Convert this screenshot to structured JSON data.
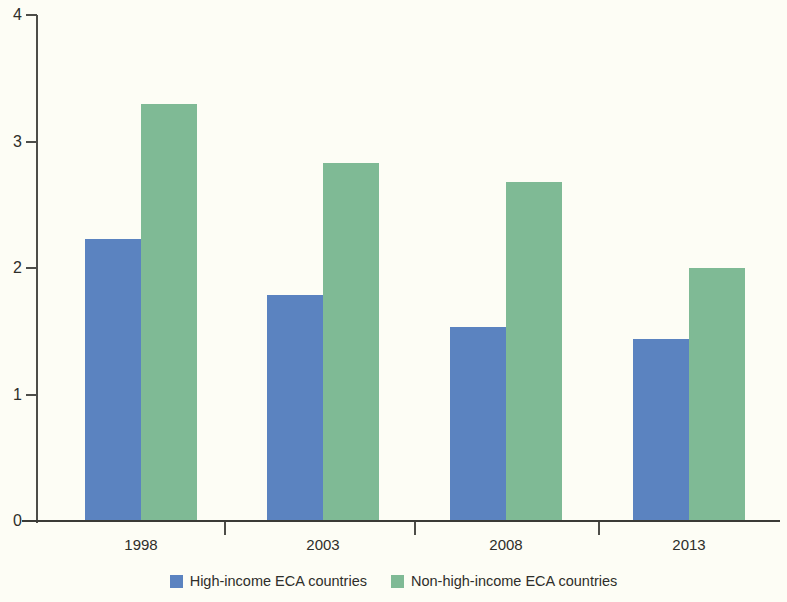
{
  "chart_data": {
    "type": "bar",
    "title": "",
    "subtitle": "",
    "xlabel": "",
    "ylabel": "",
    "categories": [
      "1998",
      "2003",
      "2008",
      "2013"
    ],
    "series": [
      {
        "name": "High-income ECA countries",
        "color": "#5b83c0",
        "values": [
          2.23,
          1.79,
          1.53,
          1.44
        ]
      },
      {
        "name": "Non-high-income ECA countries",
        "color": "#7fba95",
        "values": [
          3.3,
          2.83,
          2.68,
          2.0
        ]
      }
    ],
    "ylim": [
      0,
      4
    ],
    "yticks": [
      0,
      1,
      2,
      3,
      4
    ],
    "ytick_labels": [
      "0",
      "1",
      "2",
      "3",
      "4"
    ],
    "grid": false,
    "legend_position": "bottom",
    "background_color": "#fdfdf5",
    "axis_color": "#4d4d48"
  }
}
